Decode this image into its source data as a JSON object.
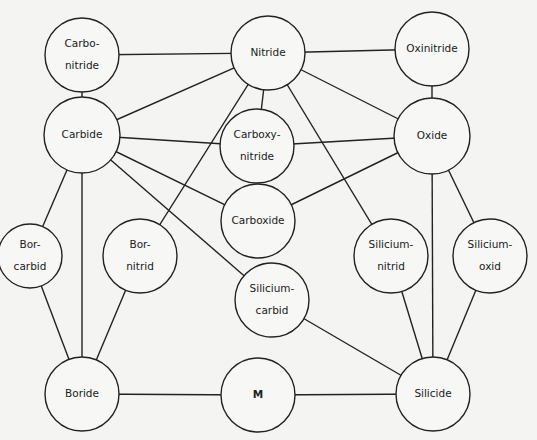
{
  "diagram": {
    "title": "",
    "colors": {
      "line": "#222222",
      "background": "#f4f4f2",
      "node_fill": "#f7f7f5"
    },
    "nodes": [
      {
        "id": "carbonitride",
        "lines": [
          "Carbo-",
          "nitride"
        ],
        "cx": 82,
        "cy": 55,
        "r": 37
      },
      {
        "id": "nitride",
        "lines": [
          "Nitride"
        ],
        "cx": 268,
        "cy": 53,
        "r": 37
      },
      {
        "id": "oxinitride",
        "lines": [
          "Oxinitride"
        ],
        "cx": 432,
        "cy": 49,
        "r": 37
      },
      {
        "id": "carbide",
        "lines": [
          "Carbide"
        ],
        "cx": 82,
        "cy": 135,
        "r": 38
      },
      {
        "id": "carboxynitride",
        "lines": [
          "Carboxy-",
          "nitride"
        ],
        "cx": 257,
        "cy": 146,
        "r": 37
      },
      {
        "id": "oxide",
        "lines": [
          "Oxide"
        ],
        "cx": 432,
        "cy": 136,
        "r": 38
      },
      {
        "id": "carboxide",
        "lines": [
          "Carboxide"
        ],
        "cx": 258,
        "cy": 221,
        "r": 37
      },
      {
        "id": "borcarbid",
        "lines": [
          "Bor-",
          "carbid"
        ],
        "cx": 30,
        "cy": 256,
        "r": 32
      },
      {
        "id": "bornitrid",
        "lines": [
          "Bor-",
          "nitrid"
        ],
        "cx": 140,
        "cy": 256,
        "r": 37
      },
      {
        "id": "siliciumcarbid",
        "lines": [
          "Silicium-",
          "carbid"
        ],
        "cx": 272,
        "cy": 300,
        "r": 37
      },
      {
        "id": "siliciumnitrid",
        "lines": [
          "Silicium-",
          "nitrid"
        ],
        "cx": 391,
        "cy": 256,
        "r": 37
      },
      {
        "id": "siliciumoxid",
        "lines": [
          "Silicium-",
          "oxid"
        ],
        "cx": 490,
        "cy": 256,
        "r": 37
      },
      {
        "id": "boride",
        "lines": [
          "Boride"
        ],
        "cx": 82,
        "cy": 394,
        "r": 37
      },
      {
        "id": "m",
        "lines": [
          "M"
        ],
        "cx": 258,
        "cy": 395,
        "r": 37,
        "bold": true
      },
      {
        "id": "silicide",
        "lines": [
          "Silicide"
        ],
        "cx": 433,
        "cy": 394,
        "r": 37
      }
    ],
    "edges": [
      [
        "carbonitride",
        "nitride"
      ],
      [
        "carbonitride",
        "carbide"
      ],
      [
        "nitride",
        "oxinitride"
      ],
      [
        "nitride",
        "carbide"
      ],
      [
        "nitride",
        "carboxynitride"
      ],
      [
        "nitride",
        "oxide"
      ],
      [
        "nitride",
        "bornitrid"
      ],
      [
        "nitride",
        "siliciumnitrid"
      ],
      [
        "oxinitride",
        "oxide"
      ],
      [
        "carbide",
        "carboxynitride"
      ],
      [
        "carbide",
        "carboxide"
      ],
      [
        "carbide",
        "siliciumcarbid"
      ],
      [
        "carbide",
        "borcarbid"
      ],
      [
        "carbide",
        "boride"
      ],
      [
        "carboxynitride",
        "oxide"
      ],
      [
        "carboxide",
        "oxide"
      ],
      [
        "oxide",
        "silicide"
      ],
      [
        "oxide",
        "siliciumoxid"
      ],
      [
        "borcarbid",
        "boride"
      ],
      [
        "bornitrid",
        "boride"
      ],
      [
        "siliciumcarbid",
        "silicide"
      ],
      [
        "siliciumnitrid",
        "silicide"
      ],
      [
        "siliciumoxid",
        "silicide"
      ],
      [
        "boride",
        "m"
      ],
      [
        "m",
        "silicide"
      ]
    ]
  }
}
